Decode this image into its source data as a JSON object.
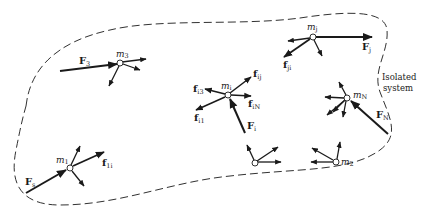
{
  "figure": {
    "boundary_label_line1": "Isolated",
    "boundary_label_line2": "system",
    "colors": {
      "ink": "#1a1a1a",
      "background": "#ffffff"
    }
  },
  "particles": [
    {
      "id": "m3",
      "label": "m",
      "sub": "3",
      "external_force": {
        "label": "F",
        "sub": "3"
      }
    },
    {
      "id": "mi",
      "label": "m",
      "sub": "i",
      "external_force": {
        "label": "F",
        "sub": "i"
      },
      "internal_forces": [
        {
          "label": "f",
          "sub": "ij"
        },
        {
          "label": "f",
          "sub": "iN"
        },
        {
          "label": "f",
          "sub": "i3"
        },
        {
          "label": "f",
          "sub": "i1"
        }
      ]
    },
    {
      "id": "mj",
      "label": "m",
      "sub": "j",
      "external_force": {
        "label": "F",
        "sub": "j"
      },
      "internal_forces": [
        {
          "label": "f",
          "sub": "ji"
        }
      ]
    },
    {
      "id": "mN",
      "label": "m",
      "sub": "N",
      "external_force": {
        "label": "F",
        "sub": "N"
      }
    },
    {
      "id": "m1",
      "label": "m",
      "sub": "1",
      "external_force": {
        "label": "F",
        "sub": "s"
      },
      "internal_forces": [
        {
          "label": "f",
          "sub": "1i"
        }
      ]
    },
    {
      "id": "m2",
      "label": "m",
      "sub": "2"
    },
    {
      "id": "unlabeled",
      "label": "",
      "sub": ""
    }
  ]
}
